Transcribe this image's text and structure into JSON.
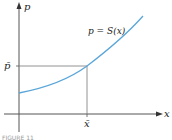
{
  "diagram": {
    "y_axis_label": "p",
    "x_axis_label": "x",
    "curve_label": "p = S(x)",
    "point_y_label": "p̄",
    "point_x_label": "x̄",
    "caption": "FIGURE 11",
    "colors": {
      "curve": "#5aa6d8",
      "axes": "#555555",
      "guides": "#777777"
    }
  }
}
